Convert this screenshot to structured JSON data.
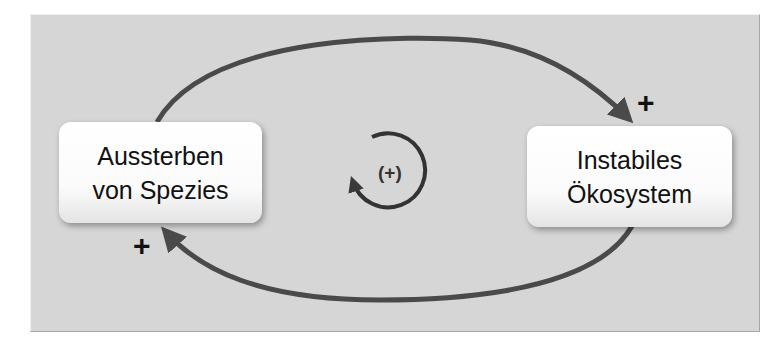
{
  "diagram": {
    "type": "causal-loop",
    "nodes": [
      {
        "id": "left",
        "lines": [
          "Aussterben",
          "von Spezies"
        ]
      },
      {
        "id": "right",
        "lines": [
          "Instabiles",
          "Ökosystem"
        ]
      }
    ],
    "edges": [
      {
        "from": "Aussterben von Spezies",
        "to": "Instabiles Ökosystem",
        "polarity": "+",
        "path": "top-arc"
      },
      {
        "from": "Instabiles Ökosystem",
        "to": "Aussterben von Spezies",
        "polarity": "+",
        "path": "bottom-arc"
      }
    ],
    "polarity_top": "+",
    "polarity_bottom": "+",
    "loop_indicator": {
      "label": "(+)",
      "icon": "circular-arrow-icon"
    },
    "colors": {
      "background": "#d6d6d6",
      "arrow": "#4a4a4a",
      "node_fill": "#ffffff",
      "text": "#111111"
    }
  }
}
